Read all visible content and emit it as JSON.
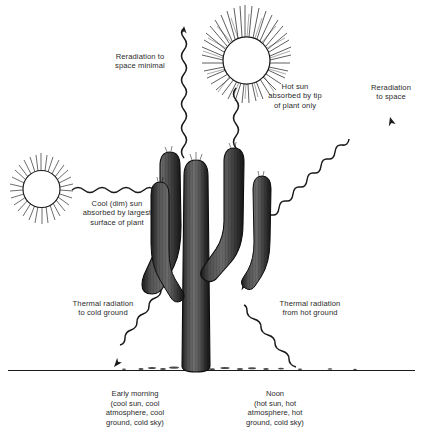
{
  "diagram": {
    "background": "#ffffff",
    "ink": "#1a1a1a",
    "text_color": "#2b2b2b"
  },
  "labels": {
    "reradiation_minimal": "Reradiation to\nspace minimal",
    "hot_sun": "Hot sun\nabsorbed by tip\nof plant only",
    "reradiation_space": "Reradiation\nto space",
    "cool_sun": "Cool (dim) sun\nabsorbed by largest\nsurface of plant",
    "thermal_cold_ground": "Thermal radiation\nto cold ground",
    "thermal_hot_ground": "Thermal radiation\nfrom hot ground"
  },
  "captions": {
    "morning": "Early morning\n(cool sun, cool\natmosphere, cool\nground, cold sky)",
    "noon": "Noon\n(hot sun, hot\natmosphere, hot\nground, cold sky)"
  },
  "objects": {
    "sun_hot": "sun-icon",
    "sun_cool": "sun-icon",
    "plant": "saguaro-cactus",
    "ground": "ground-line"
  }
}
